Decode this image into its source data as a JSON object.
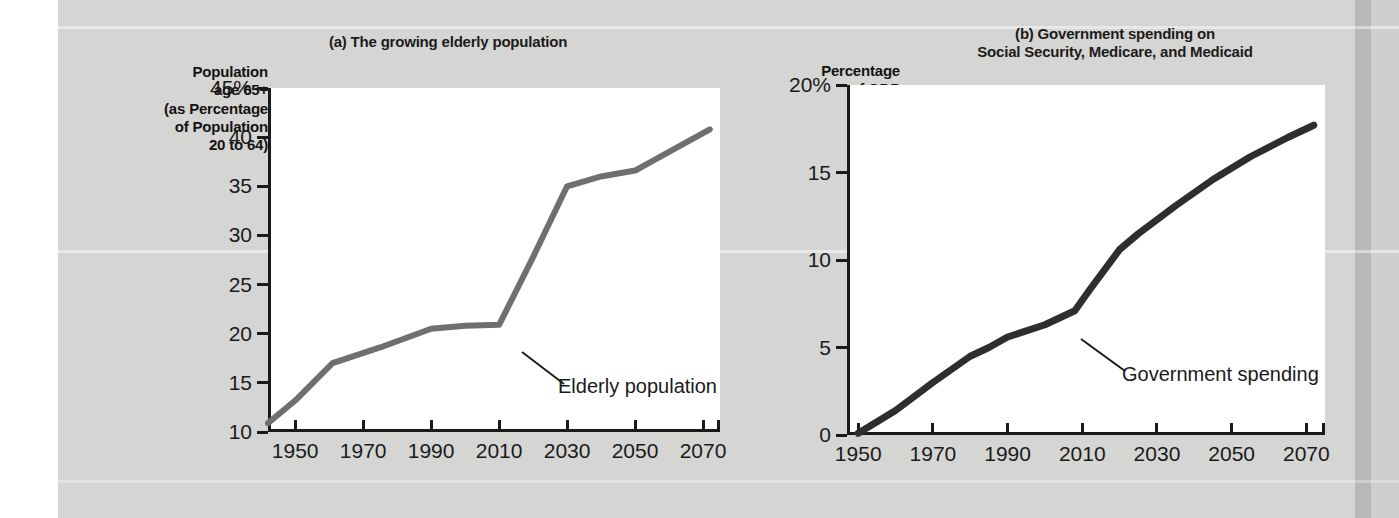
{
  "figure": {
    "background_color": "#d5d5d3",
    "plot_background_color": "#ffffff",
    "axis_color": "#1a1a1a"
  },
  "chart_data": [
    {
      "type": "line",
      "panel": "a",
      "title": "(a) The growing elderly population",
      "ylabel": "Population age 65+ (as Percentage of Population 20 to 64)",
      "ylabel_lines": [
        "Population",
        "age 65+",
        "(as Percentage",
        "of Population",
        "20 to 64)"
      ],
      "xlabel": "",
      "series_name": "Elderly population",
      "series_color": "#6f6f6f",
      "xlim": [
        1942,
        2075
      ],
      "ylim": [
        10,
        45
      ],
      "xticks": [
        1950,
        1970,
        1990,
        2010,
        2030,
        2050,
        2070
      ],
      "xtick_labels": [
        "1950",
        "1970",
        "1990",
        "2010",
        "2030",
        "2050",
        "2070"
      ],
      "yticks": [
        10,
        15,
        20,
        25,
        30,
        35,
        40,
        45
      ],
      "ytick_labels": [
        "10",
        "15",
        "20",
        "25",
        "30",
        "35",
        "40",
        "45%"
      ],
      "grid": false,
      "legend": "none",
      "annotation": "Elderly population",
      "x": [
        1942,
        1950,
        1961,
        1975,
        1990,
        2000,
        2010,
        2020,
        2030,
        2040,
        2050,
        2060,
        2072
      ],
      "values": [
        10.9,
        13.2,
        17.0,
        18.6,
        20.5,
        20.8,
        20.9,
        27.8,
        35.0,
        36.0,
        36.6,
        38.5,
        40.8
      ]
    },
    {
      "type": "line",
      "panel": "b",
      "title": "(b) Government spending on Social Security, Medicare, and Medicaid",
      "title_lines": [
        "(b) Government spending on",
        "Social Security, Medicare, and Medicaid"
      ],
      "ylabel": "Percentage of GDP",
      "ylabel_lines": [
        "Percentage",
        "of GDP"
      ],
      "xlabel": "",
      "series_name": "Government spending",
      "series_color": "#2e2e2e",
      "xlim": [
        1947,
        2075
      ],
      "ylim": [
        0,
        20
      ],
      "xticks": [
        1950,
        1970,
        1990,
        2010,
        2030,
        2050,
        2070
      ],
      "xtick_labels": [
        "1950",
        "1970",
        "1990",
        "2010",
        "2030",
        "2050",
        "2070"
      ],
      "yticks": [
        0,
        5,
        10,
        15,
        20
      ],
      "ytick_labels": [
        "0",
        "5",
        "10",
        "15",
        "20%"
      ],
      "grid": false,
      "legend": "none",
      "annotation": "Government spending",
      "x": [
        1950,
        1960,
        1970,
        1980,
        1985,
        1990,
        2000,
        2008,
        2012,
        2020,
        2025,
        2035,
        2045,
        2055,
        2065,
        2072
      ],
      "values": [
        0.1,
        1.4,
        3.0,
        4.5,
        5.0,
        5.6,
        6.3,
        7.1,
        8.3,
        10.6,
        11.5,
        13.1,
        14.6,
        15.9,
        17.0,
        17.7
      ]
    }
  ]
}
